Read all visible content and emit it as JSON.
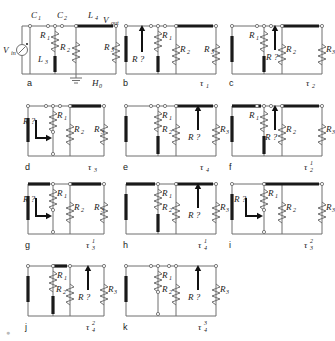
{
  "figure": {
    "kind": "circuit-diagram-grid",
    "panel_count": 11,
    "component_labels": {
      "v_in": "V",
      "v_in_sub": "in",
      "v_out": "V",
      "v_out_sub": "out",
      "c1": "C",
      "c1_sub": "1",
      "c2": "C",
      "c2_sub": "2",
      "l4": "L",
      "l4_sub": "4",
      "l3": "L",
      "l3_sub": "3",
      "r1": "R",
      "r1_sub": "1",
      "r2": "R",
      "r2_sub": "2",
      "r3": "R",
      "r3_sub": "3",
      "h0": "H",
      "h0_sub": "0",
      "probe": "R ?",
      "tau": "τ"
    },
    "panels": [
      {
        "id": "a",
        "caption": "",
        "caption_sub": "",
        "caption_sup": "",
        "extra_label": "H",
        "extra_label_sub": "0",
        "has_source": true,
        "has_ground": true,
        "has_caps": true,
        "probe": "",
        "probe_style": "none",
        "resistors": [
          "R1",
          "R2",
          "R3"
        ],
        "inductors": [
          "L3",
          "L4"
        ],
        "capacitors": [
          "C1",
          "C2"
        ],
        "output": "V_out"
      },
      {
        "id": "b",
        "caption": "τ",
        "caption_sub": "1",
        "caption_sup": "",
        "probe": "R ?",
        "probe_style": "up-left",
        "resistors": [
          "R1",
          "R2",
          "R3"
        ]
      },
      {
        "id": "c",
        "caption": "τ",
        "caption_sub": "2",
        "caption_sup": "",
        "probe": "R ?",
        "probe_style": "up-mid",
        "resistors": [
          "R1",
          "R2",
          "R3"
        ]
      },
      {
        "id": "d",
        "caption": "τ",
        "caption_sub": "3",
        "caption_sup": "",
        "probe": "R ?",
        "probe_style": "bent",
        "resistors": [
          "R1",
          "R2",
          "R3"
        ]
      },
      {
        "id": "e",
        "caption": "τ",
        "caption_sub": "4",
        "caption_sup": "",
        "probe": "R ?",
        "probe_style": "up-right",
        "resistors": [
          "R1",
          "R2",
          "R3"
        ]
      },
      {
        "id": "f",
        "caption": "τ",
        "caption_sub": "2",
        "caption_sup": "1",
        "probe": "R ?",
        "probe_style": "up-mid",
        "resistors": [
          "R1",
          "R2",
          "R3"
        ]
      },
      {
        "id": "g",
        "caption": "τ",
        "caption_sub": "3",
        "caption_sup": "1",
        "probe": "R ?",
        "probe_style": "bent",
        "resistors": [
          "R1",
          "R2",
          "R3"
        ]
      },
      {
        "id": "h",
        "caption": "τ",
        "caption_sub": "4",
        "caption_sup": "1",
        "probe": "R ?",
        "probe_style": "up-right",
        "resistors": [
          "R1",
          "R2",
          "R3"
        ]
      },
      {
        "id": "i",
        "caption": "τ",
        "caption_sub": "3",
        "caption_sup": "2",
        "probe": "R ?",
        "probe_style": "bent",
        "resistors": [
          "R1",
          "R2",
          "R3"
        ]
      },
      {
        "id": "j",
        "caption": "τ",
        "caption_sub": "4",
        "caption_sup": "2",
        "probe": "R ?",
        "probe_style": "up-right",
        "resistors": [
          "R1",
          "R2",
          "R3"
        ]
      },
      {
        "id": "k",
        "caption": "τ",
        "caption_sub": "4",
        "caption_sup": "3",
        "probe": "R ?",
        "probe_style": "up-right",
        "resistors": [
          "R1",
          "R2",
          "R3"
        ]
      }
    ]
  },
  "colors": {
    "wire": "#6f6f6f",
    "thick_wire": "#1a1a1a",
    "text": "#1a1a1a",
    "background": "#ffffff"
  },
  "footer_mark": "●"
}
